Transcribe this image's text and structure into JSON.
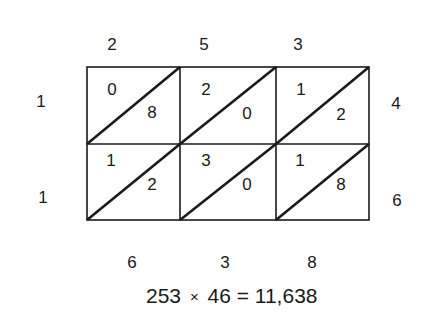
{
  "top_digits": [
    "2",
    "5",
    "3"
  ],
  "left_digits": [
    "1",
    "1"
  ],
  "right_digits": [
    "4",
    "6"
  ],
  "cells": [
    [
      {
        "tens": "0",
        "ones": "8"
      },
      {
        "tens": "2",
        "ones": "0"
      },
      {
        "tens": "1",
        "ones": "2"
      }
    ],
    [
      {
        "tens": "1",
        "ones": "2"
      },
      {
        "tens": "3",
        "ones": "0"
      },
      {
        "tens": "1",
        "ones": "8"
      }
    ]
  ],
  "bottom_digits": [
    "6",
    "3",
    "8"
  ],
  "equation": {
    "left": "253",
    "operator": "×",
    "right": "46",
    "equals": "=",
    "result": "11,638"
  }
}
